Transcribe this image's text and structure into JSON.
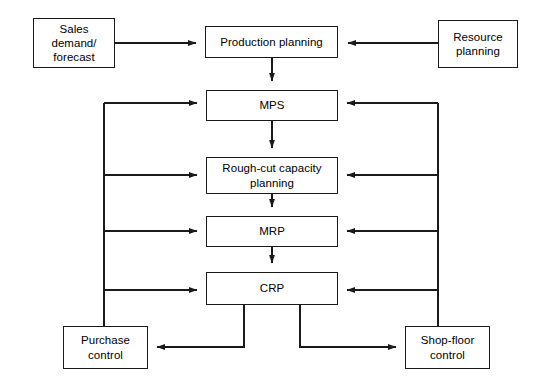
{
  "diagram": {
    "background_color": "#ffffff",
    "line_color": "#1a1a1a",
    "text_color": "#000000",
    "nodes": [
      {
        "id": "sales",
        "label": "Sales\ndemand/\nforecast",
        "x": 33,
        "y": 18,
        "w": 82,
        "h": 50
      },
      {
        "id": "production_planning",
        "label": "Production planning",
        "x": 205,
        "y": 26,
        "w": 133,
        "h": 32
      },
      {
        "id": "resource_planning",
        "label": "Resource\nplanning",
        "x": 438,
        "y": 20,
        "w": 80,
        "h": 48
      },
      {
        "id": "mps",
        "label": "MPS",
        "x": 206,
        "y": 90,
        "w": 132,
        "h": 31
      },
      {
        "id": "rough_cut",
        "label": "Rough-cut capacity\nplanning",
        "x": 206,
        "y": 157,
        "w": 132,
        "h": 37
      },
      {
        "id": "mrp",
        "label": "MRP",
        "x": 206,
        "y": 216,
        "w": 132,
        "h": 31
      },
      {
        "id": "crp",
        "label": "CRP",
        "x": 206,
        "y": 272,
        "w": 132,
        "h": 33
      },
      {
        "id": "purchase_control",
        "label": "Purchase\ncontrol",
        "x": 63,
        "y": 326,
        "w": 85,
        "h": 43
      },
      {
        "id": "shop_floor_control",
        "label": "Shop-floor\ncontrol",
        "x": 405,
        "y": 326,
        "w": 85,
        "h": 43
      }
    ],
    "edges": [
      {
        "from": "sales",
        "to": "production_planning",
        "direction": "right"
      },
      {
        "from": "resource_planning",
        "to": "production_planning",
        "direction": "left"
      },
      {
        "from": "production_planning",
        "to": "mps",
        "direction": "down"
      },
      {
        "from": "mps",
        "to": "rough_cut",
        "direction": "down"
      },
      {
        "from": "rough_cut",
        "to": "mrp",
        "direction": "down"
      },
      {
        "from": "mrp",
        "to": "crp",
        "direction": "down"
      },
      {
        "from": "purchase_control",
        "to": "mps",
        "direction": "feedback-left"
      },
      {
        "from": "purchase_control",
        "to": "rough_cut",
        "direction": "feedback-left"
      },
      {
        "from": "purchase_control",
        "to": "mrp",
        "direction": "feedback-left"
      },
      {
        "from": "purchase_control",
        "to": "crp",
        "direction": "feedback-left"
      },
      {
        "from": "shop_floor_control",
        "to": "mps",
        "direction": "feedback-right"
      },
      {
        "from": "shop_floor_control",
        "to": "rough_cut",
        "direction": "feedback-right"
      },
      {
        "from": "shop_floor_control",
        "to": "mrp",
        "direction": "feedback-right"
      },
      {
        "from": "shop_floor_control",
        "to": "crp",
        "direction": "feedback-right"
      },
      {
        "from": "crp",
        "to": "purchase_control",
        "direction": "down-left"
      },
      {
        "from": "crp",
        "to": "shop_floor_control",
        "direction": "down-right"
      }
    ]
  }
}
